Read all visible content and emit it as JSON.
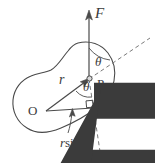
{
  "figure": {
    "background_color": "#ffffff",
    "stroke_color": "#4a4a4a",
    "text_color": "#3b3b3b",
    "dash_color": "#7a7a7a"
  },
  "labels": {
    "force_vector": "F",
    "position_vector": "r",
    "point_p": "P",
    "point_o": "O",
    "angle_top": "θ",
    "angle_bottom": "θ",
    "moment_arm": "r sinθ",
    "moment_arm_variable": "r",
    "moment_arm_function": "sin",
    "moment_arm_angle": "θ"
  },
  "annotations": {
    "right_angle_marker": "right-angle",
    "body_shape": "irregular-rigid-body-blob",
    "dashed_line": "line-of-action-extension"
  },
  "geometry": {
    "point_o": [
      46,
      111
    ],
    "point_p": [
      89,
      79
    ],
    "force_tip": [
      89,
      12
    ],
    "perp_foot": [
      93,
      110
    ],
    "dash_upper_end": [
      150,
      38
    ],
    "dash_lower_end": [
      101,
      158
    ]
  }
}
